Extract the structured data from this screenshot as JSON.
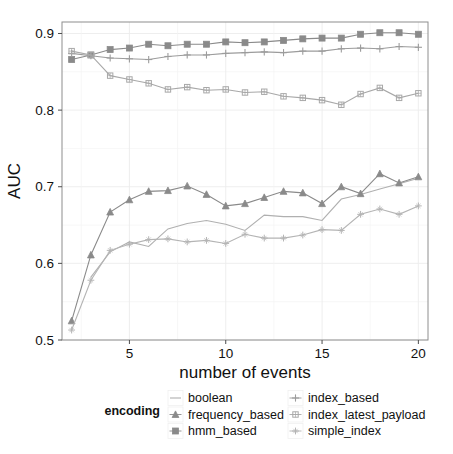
{
  "chart_data": {
    "type": "line",
    "title": "",
    "xlabel": "number of events",
    "ylabel": "AUC",
    "xlim": [
      1.5,
      20.5
    ],
    "ylim": [
      0.5,
      0.915
    ],
    "xticks": [
      5,
      10,
      15,
      20
    ],
    "yticks": [
      0.5,
      0.6,
      0.7,
      0.8,
      0.9
    ],
    "ytick_labels": [
      "0.5",
      "0.6",
      "0.7",
      "0.8",
      "0.9"
    ],
    "xtick_labels": [
      "5",
      "10",
      "15",
      "20"
    ],
    "grid": true,
    "legend_position": "bottom",
    "legend_title": "encoding",
    "x": [
      2,
      3,
      4,
      5,
      6,
      7,
      8,
      9,
      10,
      11,
      12,
      13,
      14,
      15,
      16,
      17,
      18,
      19,
      20
    ],
    "series": [
      {
        "name": "boolean",
        "marker": "none",
        "color": "#b0b0b0",
        "x": [
          3,
          4,
          5,
          6,
          7,
          8,
          9,
          10,
          11,
          12,
          13,
          14,
          15,
          16,
          17,
          18,
          19,
          20
        ],
        "values": [
          0.582,
          0.615,
          0.628,
          0.622,
          0.645,
          0.652,
          0.656,
          0.651,
          0.643,
          0.663,
          0.661,
          0.661,
          0.656,
          0.684,
          0.69,
          0.697,
          0.704,
          0.711
        ]
      },
      {
        "name": "frequency_based",
        "marker": "triangle",
        "color": "#8a8a8a",
        "x": [
          2,
          3,
          4,
          5,
          6,
          7,
          8,
          9,
          10,
          11,
          12,
          13,
          14,
          15,
          16,
          17,
          18,
          19,
          20
        ],
        "values": [
          0.525,
          0.611,
          0.667,
          0.683,
          0.694,
          0.695,
          0.701,
          0.69,
          0.675,
          0.678,
          0.686,
          0.694,
          0.692,
          0.678,
          0.7,
          0.691,
          0.717,
          0.705,
          0.713
        ]
      },
      {
        "name": "hmm_based",
        "marker": "square-filled",
        "color": "#8a8a8a",
        "x": [
          2,
          3,
          4,
          5,
          6,
          7,
          8,
          9,
          10,
          11,
          12,
          13,
          14,
          15,
          16,
          17,
          18,
          19,
          20
        ],
        "values": [
          0.866,
          0.872,
          0.879,
          0.881,
          0.886,
          0.884,
          0.886,
          0.886,
          0.889,
          0.888,
          0.889,
          0.891,
          0.893,
          0.894,
          0.894,
          0.899,
          0.901,
          0.901,
          0.899
        ]
      },
      {
        "name": "index_based",
        "marker": "plus",
        "color": "#9c9c9c",
        "x": [
          2,
          3,
          4,
          5,
          6,
          7,
          8,
          9,
          10,
          11,
          12,
          13,
          14,
          15,
          16,
          17,
          18,
          19,
          20
        ],
        "values": [
          0.874,
          0.871,
          0.868,
          0.867,
          0.866,
          0.87,
          0.872,
          0.872,
          0.874,
          0.875,
          0.876,
          0.875,
          0.877,
          0.877,
          0.88,
          0.881,
          0.88,
          0.883,
          0.882
        ]
      },
      {
        "name": "index_latest_payload",
        "marker": "square-open",
        "color": "#a8a8a8",
        "x": [
          2,
          3,
          4,
          5,
          6,
          7,
          8,
          9,
          10,
          11,
          12,
          13,
          14,
          15,
          16,
          17,
          18,
          19,
          20
        ],
        "values": [
          0.877,
          0.872,
          0.845,
          0.84,
          0.835,
          0.827,
          0.83,
          0.826,
          0.827,
          0.823,
          0.824,
          0.818,
          0.816,
          0.813,
          0.807,
          0.821,
          0.829,
          0.816,
          0.822
        ]
      },
      {
        "name": "simple_index",
        "marker": "cross",
        "color": "#b4b4b4",
        "x": [
          2,
          3,
          4,
          5,
          6,
          7,
          8,
          9,
          10,
          11,
          12,
          13,
          14,
          15,
          16,
          17,
          18,
          19,
          20
        ],
        "values": [
          0.513,
          0.578,
          0.617,
          0.625,
          0.631,
          0.632,
          0.628,
          0.63,
          0.626,
          0.638,
          0.633,
          0.633,
          0.637,
          0.644,
          0.643,
          0.664,
          0.671,
          0.664,
          0.675
        ]
      }
    ]
  },
  "legend": {
    "title": "encoding",
    "columns": [
      [
        {
          "label": "boolean",
          "key": "line"
        },
        {
          "label": "frequency_based",
          "key": "triangle"
        },
        {
          "label": "hmm_based",
          "key": "square-filled"
        }
      ],
      [
        {
          "label": "index_based",
          "key": "plus"
        },
        {
          "label": "index_latest_payload",
          "key": "square-open"
        },
        {
          "label": "simple_index",
          "key": "cross"
        }
      ]
    ]
  }
}
